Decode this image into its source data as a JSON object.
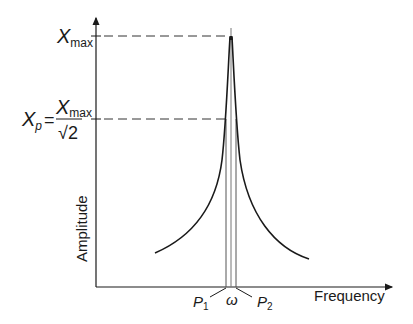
{
  "diagram": {
    "axes": {
      "x_label": "Frequency",
      "y_label": "Amplitude"
    },
    "y_markers": {
      "max": {
        "symbol": "X",
        "subscript": "max"
      },
      "half_power": {
        "lhs_symbol": "X",
        "lhs_subscript": "p",
        "equals": "=",
        "numerator_symbol": "X",
        "numerator_subscript": "max",
        "denominator": "√2"
      }
    },
    "x_markers": {
      "p1": {
        "symbol": "P",
        "subscript": "1"
      },
      "omega": {
        "symbol": "ω"
      },
      "p2": {
        "symbol": "P",
        "subscript": "2"
      }
    },
    "colors": {
      "line": "#1a1a1a",
      "dashed": "#333333",
      "vertical_markers": "#555555"
    }
  }
}
